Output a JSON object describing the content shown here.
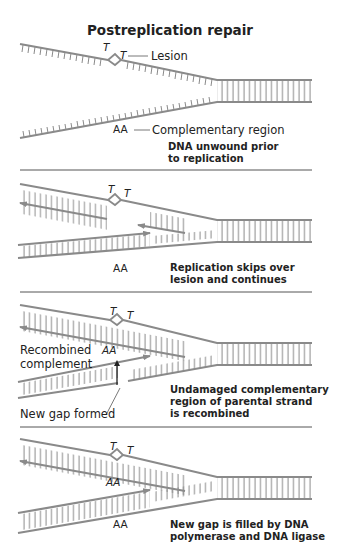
{
  "title": "Postreplication repair",
  "colors": {
    "strand": "#8a8a8a",
    "divider": "#555555",
    "text": "#222222"
  },
  "panels": [
    {
      "caption_line1": "DNA unwound prior",
      "caption_line2": "to replication",
      "lesion_bases": [
        "T",
        "T"
      ],
      "lesion_label": "Lesion",
      "complement_bases": "AA",
      "complement_label": "Complementary region"
    },
    {
      "caption_line1": "Replication skips over",
      "caption_line2": "lesion and continues",
      "lesion_bases": [
        "T",
        "T"
      ],
      "complement_bases": "AA"
    },
    {
      "caption_line1": "Undamaged complementary",
      "caption_line2": "region of parental strand",
      "caption_line3": "is recombined",
      "lesion_bases": [
        "T",
        "T"
      ],
      "recombined_label_line1": "Recombined",
      "recombined_label_line2": "complement",
      "recombined_bases": "AA",
      "gap_label": "New gap formed"
    },
    {
      "caption_line1": "New gap is filled by DNA",
      "caption_line2": "polymerase and DNA ligase",
      "lesion_bases": [
        "T",
        "T"
      ],
      "upper_bases": "AA",
      "lower_bases": "AA"
    }
  ]
}
